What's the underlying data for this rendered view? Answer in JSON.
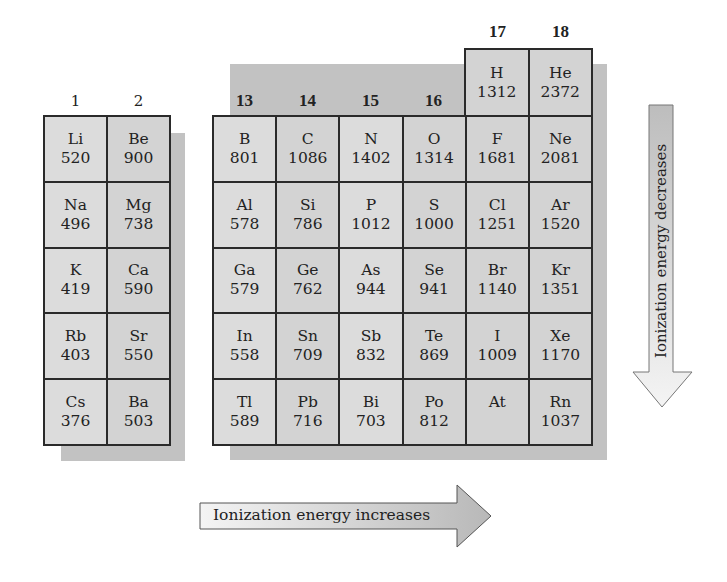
{
  "group_labels_left": [
    "1",
    "2"
  ],
  "group_labels_right": [
    "13",
    "14",
    "15",
    "16",
    "17",
    "18"
  ],
  "top_box": [
    {
      "symbol": "H",
      "energy": "1312"
    },
    {
      "symbol": "He",
      "energy": "2372"
    }
  ],
  "left_block": [
    [
      {
        "symbol": "Li",
        "energy": "520"
      },
      {
        "symbol": "Be",
        "energy": "900"
      }
    ],
    [
      {
        "symbol": "Na",
        "energy": "496"
      },
      {
        "symbol": "Mg",
        "energy": "738"
      }
    ],
    [
      {
        "symbol": "K",
        "energy": "419"
      },
      {
        "symbol": "Ca",
        "energy": "590"
      }
    ],
    [
      {
        "symbol": "Rb",
        "energy": "403"
      },
      {
        "symbol": "Sr",
        "energy": "550"
      }
    ],
    [
      {
        "symbol": "Cs",
        "energy": "376"
      },
      {
        "symbol": "Ba",
        "energy": "503"
      }
    ]
  ],
  "right_block": [
    [
      {
        "symbol": "B",
        "energy": "801"
      },
      {
        "symbol": "C",
        "energy": "1086"
      },
      {
        "symbol": "N",
        "energy": "1402"
      },
      {
        "symbol": "O",
        "energy": "1314"
      },
      {
        "symbol": "F",
        "energy": "1681"
      },
      {
        "symbol": "Ne",
        "energy": "2081"
      }
    ],
    [
      {
        "symbol": "Al",
        "energy": "578"
      },
      {
        "symbol": "Si",
        "energy": "786"
      },
      {
        "symbol": "P",
        "energy": "1012"
      },
      {
        "symbol": "S",
        "energy": "1000"
      },
      {
        "symbol": "Cl",
        "energy": "1251"
      },
      {
        "symbol": "Ar",
        "energy": "1520"
      }
    ],
    [
      {
        "symbol": "Ga",
        "energy": "579"
      },
      {
        "symbol": "Ge",
        "energy": "762"
      },
      {
        "symbol": "As",
        "energy": "944"
      },
      {
        "symbol": "Se",
        "energy": "941"
      },
      {
        "symbol": "Br",
        "energy": "1140"
      },
      {
        "symbol": "Kr",
        "energy": "1351"
      }
    ],
    [
      {
        "symbol": "In",
        "energy": "558"
      },
      {
        "symbol": "Sn",
        "energy": "709"
      },
      {
        "symbol": "Sb",
        "energy": "832"
      },
      {
        "symbol": "Te",
        "energy": "869"
      },
      {
        "symbol": "I",
        "energy": "1009"
      },
      {
        "symbol": "Xe",
        "energy": "1170"
      }
    ],
    [
      {
        "symbol": "Tl",
        "energy": "589"
      },
      {
        "symbol": "Pb",
        "energy": "716"
      },
      {
        "symbol": "Bi",
        "energy": "703"
      },
      {
        "symbol": "Po",
        "energy": "812"
      },
      {
        "symbol": "At",
        "energy": ""
      },
      {
        "symbol": "Rn",
        "energy": "1037"
      }
    ]
  ],
  "arrows": {
    "vertical_label": "Ionization energy decreases",
    "horizontal_label": "Ionization energy increases"
  },
  "colors": {
    "cell_fill": "#d3d3d3",
    "cell_fill_light": "#dcdcdc",
    "border": "#2a2a2a",
    "shadow": "#c2c2c2"
  }
}
